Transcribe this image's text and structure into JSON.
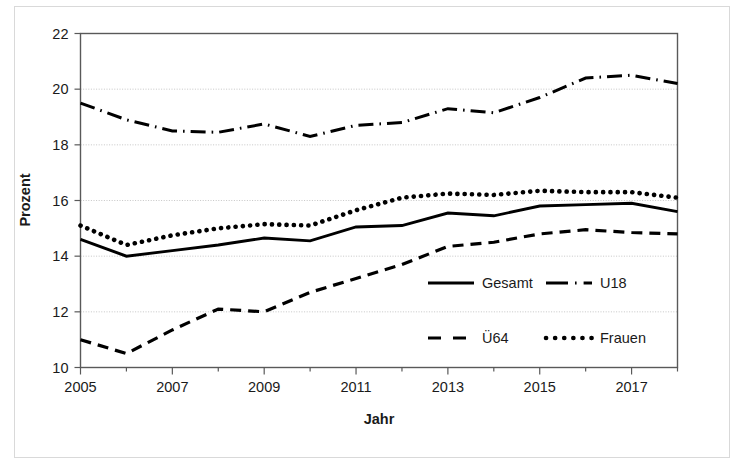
{
  "chart_data": {
    "type": "line",
    "title": "",
    "xlabel": "Jahr",
    "ylabel": "Prozent",
    "xlim": [
      2005,
      2018
    ],
    "ylim": [
      10,
      22
    ],
    "ytick_step": 2,
    "yticks": [
      10,
      12,
      14,
      16,
      18,
      20,
      22
    ],
    "xticks": [
      2005,
      2006,
      2007,
      2008,
      2009,
      2010,
      2011,
      2012,
      2013,
      2014,
      2015,
      2016,
      2017,
      2018
    ],
    "xtick_labels": [
      "2005",
      "",
      "2007",
      "",
      "2009",
      "",
      "2011",
      "",
      "2013",
      "",
      "2015",
      "",
      "2017",
      ""
    ],
    "grid": "horizontal-dotted",
    "legend_position": "inside-center-right",
    "plot_border": true,
    "x": [
      2005,
      2006,
      2007,
      2008,
      2009,
      2010,
      2011,
      2012,
      2013,
      2014,
      2015,
      2016,
      2017,
      2018
    ],
    "series": [
      {
        "name": "Gesamt",
        "style": "solid",
        "color": "#000000",
        "values": [
          14.6,
          14.0,
          14.2,
          14.4,
          14.65,
          14.55,
          15.05,
          15.1,
          15.55,
          15.45,
          15.8,
          15.85,
          15.9,
          15.6
        ]
      },
      {
        "name": "U18",
        "style": "dashdot",
        "color": "#000000",
        "values": [
          19.5,
          18.9,
          18.5,
          18.45,
          18.75,
          18.3,
          18.7,
          18.8,
          19.3,
          19.15,
          19.7,
          20.4,
          20.5,
          20.2
        ]
      },
      {
        "name": "Ü64",
        "style": "dashed",
        "color": "#000000",
        "values": [
          11.0,
          10.5,
          11.35,
          12.1,
          12.0,
          12.7,
          13.2,
          13.7,
          14.35,
          14.5,
          14.8,
          14.95,
          14.85,
          14.8
        ]
      },
      {
        "name": "Frauen",
        "style": "dotted",
        "color": "#000000",
        "values": [
          15.1,
          14.4,
          14.75,
          15.0,
          15.15,
          15.1,
          15.65,
          16.1,
          16.25,
          16.2,
          16.35,
          16.3,
          16.3,
          16.1
        ]
      }
    ]
  },
  "legend": {
    "entries": [
      {
        "label": "Gesamt",
        "style": "solid"
      },
      {
        "label": "U18",
        "style": "dashdot"
      },
      {
        "label": "Ü64",
        "style": "dashed"
      },
      {
        "label": "Frauen",
        "style": "dotted"
      }
    ]
  },
  "axes": {
    "y_title": "Prozent",
    "x_title": "Jahr"
  }
}
